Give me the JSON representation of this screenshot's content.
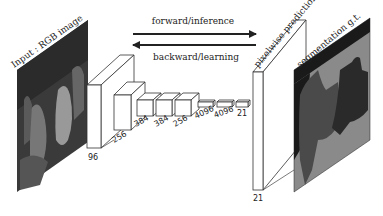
{
  "diagram": {
    "title_input": "Input : RGB image",
    "title_prediction": "pixelwise prediction",
    "title_gt": "segmentation g.t.",
    "arrows": {
      "forward": "forward/inference",
      "backward": "backward/learning"
    },
    "layers": [
      {
        "id": "conv1",
        "label": "96"
      },
      {
        "id": "conv2",
        "label": "256"
      },
      {
        "id": "conv3",
        "label": "384"
      },
      {
        "id": "conv4",
        "label": "384"
      },
      {
        "id": "conv5",
        "label": "256"
      },
      {
        "id": "fc6",
        "label": "4096"
      },
      {
        "id": "fc7",
        "label": "4096"
      },
      {
        "id": "score",
        "label": "21"
      },
      {
        "id": "prediction",
        "label": "21"
      }
    ],
    "colors": {
      "line": "#333333",
      "seg_background": "#8a8a8a",
      "seg_dark": "#1a1a1a",
      "seg_object1": "#4a4a4a",
      "seg_object2": "#2a2a2a"
    }
  }
}
